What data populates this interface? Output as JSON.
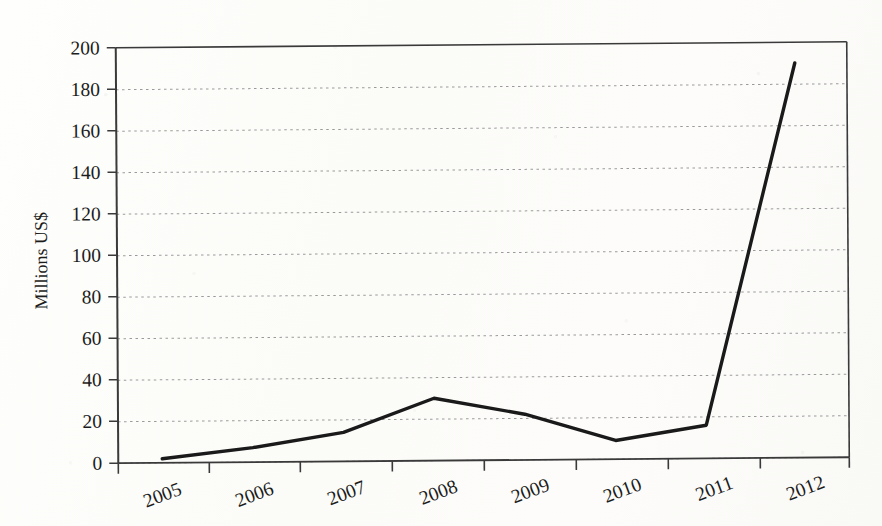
{
  "chart_data": {
    "type": "line",
    "title": "",
    "subtitle": "",
    "xlabel": "",
    "ylabel": "Millions US$",
    "categories": [
      "2005",
      "2006",
      "2007",
      "2008",
      "2009",
      "2010",
      "2011",
      "2012"
    ],
    "values": [
      2,
      7,
      14,
      30,
      22,
      9,
      16,
      190
    ],
    "series": [
      {
        "name": "Millions US$",
        "values": [
          2,
          7,
          14,
          30,
          22,
          9,
          16,
          190
        ],
        "color": "#1a1a1a",
        "line_width": 3.4,
        "markers": false
      }
    ],
    "ylim": [
      0,
      200
    ],
    "ytick_step": 20,
    "ytick_labels": [
      "0",
      "20",
      "40",
      "60",
      "80",
      "100",
      "120",
      "140",
      "160",
      "180",
      "200"
    ],
    "xtick_labels": [
      "2005",
      "2006",
      "2007",
      "2008",
      "2009",
      "2010",
      "2011",
      "2012"
    ],
    "xtick_label_rotation": -20,
    "grid": {
      "horizontal": true,
      "vertical": false,
      "style": "dotted",
      "color": "#9a9a9a"
    },
    "legend": {
      "visible": false,
      "position": "none",
      "entries": []
    },
    "annotations": [],
    "plot_border": {
      "top": true,
      "left": true,
      "right": true,
      "bottom": true,
      "color": "#2a2a2a"
    },
    "axis_line_color": "#2a2a2a",
    "background_color": "#fdfdfb"
  },
  "figure": {
    "y_axis_title": "Millions US$",
    "data_point_labels": [
      {
        "category": "2005",
        "value": 2
      },
      {
        "category": "2006",
        "value": 7
      },
      {
        "category": "2007",
        "value": 14
      },
      {
        "category": "2008",
        "value": 30
      },
      {
        "category": "2009",
        "value": 22
      },
      {
        "category": "2010",
        "value": 9
      },
      {
        "category": "2011",
        "value": 16
      },
      {
        "category": "2012",
        "value": 190
      }
    ]
  }
}
